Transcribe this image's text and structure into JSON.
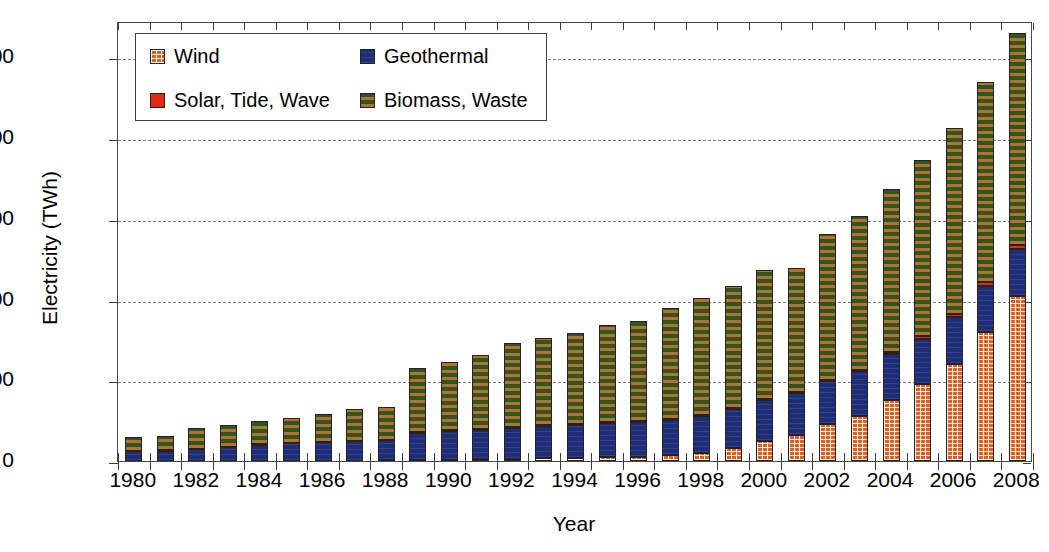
{
  "chart_data": {
    "type": "bar",
    "stacked": true,
    "title": "",
    "xlabel": "Year",
    "ylabel": "Electricity (TWh)",
    "ylim": [
      0,
      545
    ],
    "yticks": [
      0,
      100,
      200,
      300,
      400,
      500
    ],
    "ytick_labels": [
      "0",
      "100",
      "200",
      "300",
      "400",
      "500"
    ],
    "grid": "horizontal-dashed",
    "legend_position": "top-left",
    "categories": [
      "1980",
      "1981",
      "1982",
      "1983",
      "1984",
      "1985",
      "1986",
      "1987",
      "1988",
      "1989",
      "1990",
      "1991",
      "1992",
      "1993",
      "1994",
      "1995",
      "1996",
      "1997",
      "1998",
      "1999",
      "2000",
      "2001",
      "2002",
      "2003",
      "2004",
      "2005",
      "2006",
      "2007",
      "2008"
    ],
    "xtick_labels": [
      "1980",
      "1982",
      "1984",
      "1986",
      "1988",
      "1990",
      "1992",
      "1994",
      "1996",
      "1998",
      "2000",
      "2002",
      "2004",
      "2006",
      "2008"
    ],
    "series": [
      {
        "name": "Wind",
        "color": "#e2601b",
        "pattern": "checker",
        "values": [
          0,
          0,
          0,
          0,
          0,
          0.1,
          0.3,
          0.5,
          0.8,
          1,
          1.5,
          2,
          3,
          3.5,
          4,
          5,
          5.5,
          7,
          10,
          16,
          25,
          32,
          46,
          56,
          76,
          95,
          120,
          160,
          205
        ]
      },
      {
        "name": "Geothermal",
        "color": "#1d2d78",
        "pattern": "solid",
        "values": [
          12,
          13,
          15,
          17,
          20,
          22,
          23,
          24,
          25,
          34,
          36,
          37,
          38,
          40,
          41,
          42,
          43,
          44,
          46,
          48,
          50,
          52,
          53,
          55,
          56,
          56,
          58,
          57,
          57
        ]
      },
      {
        "name": "Solar, Tide, Wave",
        "color": "#e02a15",
        "pattern": "solid",
        "values": [
          0.5,
          0.5,
          0.5,
          0.5,
          0.5,
          0.5,
          0.5,
          0.6,
          0.6,
          0.6,
          0.7,
          0.7,
          0.8,
          0.8,
          0.8,
          0.9,
          1,
          1,
          1,
          1.2,
          1.3,
          1.5,
          1.8,
          2,
          2.5,
          3.5,
          4,
          5,
          6
        ]
      },
      {
        "name": "Biomass, Waste",
        "color": "#2e5622",
        "pattern": "checker",
        "values": [
          17,
          17,
          26,
          27,
          29,
          31,
          34,
          39,
          41,
          80,
          85,
          92,
          105,
          108,
          113,
          120,
          124,
          137,
          145,
          151,
          160,
          154,
          180,
          191,
          202,
          218,
          231,
          248,
          262
        ]
      }
    ],
    "totals": [
      30,
      30,
      42,
      45,
      50,
      53,
      58,
      64,
      67,
      116,
      123,
      132,
      147,
      152,
      159,
      168,
      174,
      189,
      202,
      216,
      236,
      240,
      281,
      304,
      337,
      373,
      413,
      470,
      530
    ]
  },
  "legend": {
    "items": [
      {
        "label": "Wind",
        "color": "#e2601b"
      },
      {
        "label": "Geothermal",
        "color": "#1d2d78"
      },
      {
        "label": "Solar, Tide, Wave",
        "color": "#e02a15"
      },
      {
        "label": "Biomass, Waste",
        "color": "#2e5622"
      }
    ]
  }
}
